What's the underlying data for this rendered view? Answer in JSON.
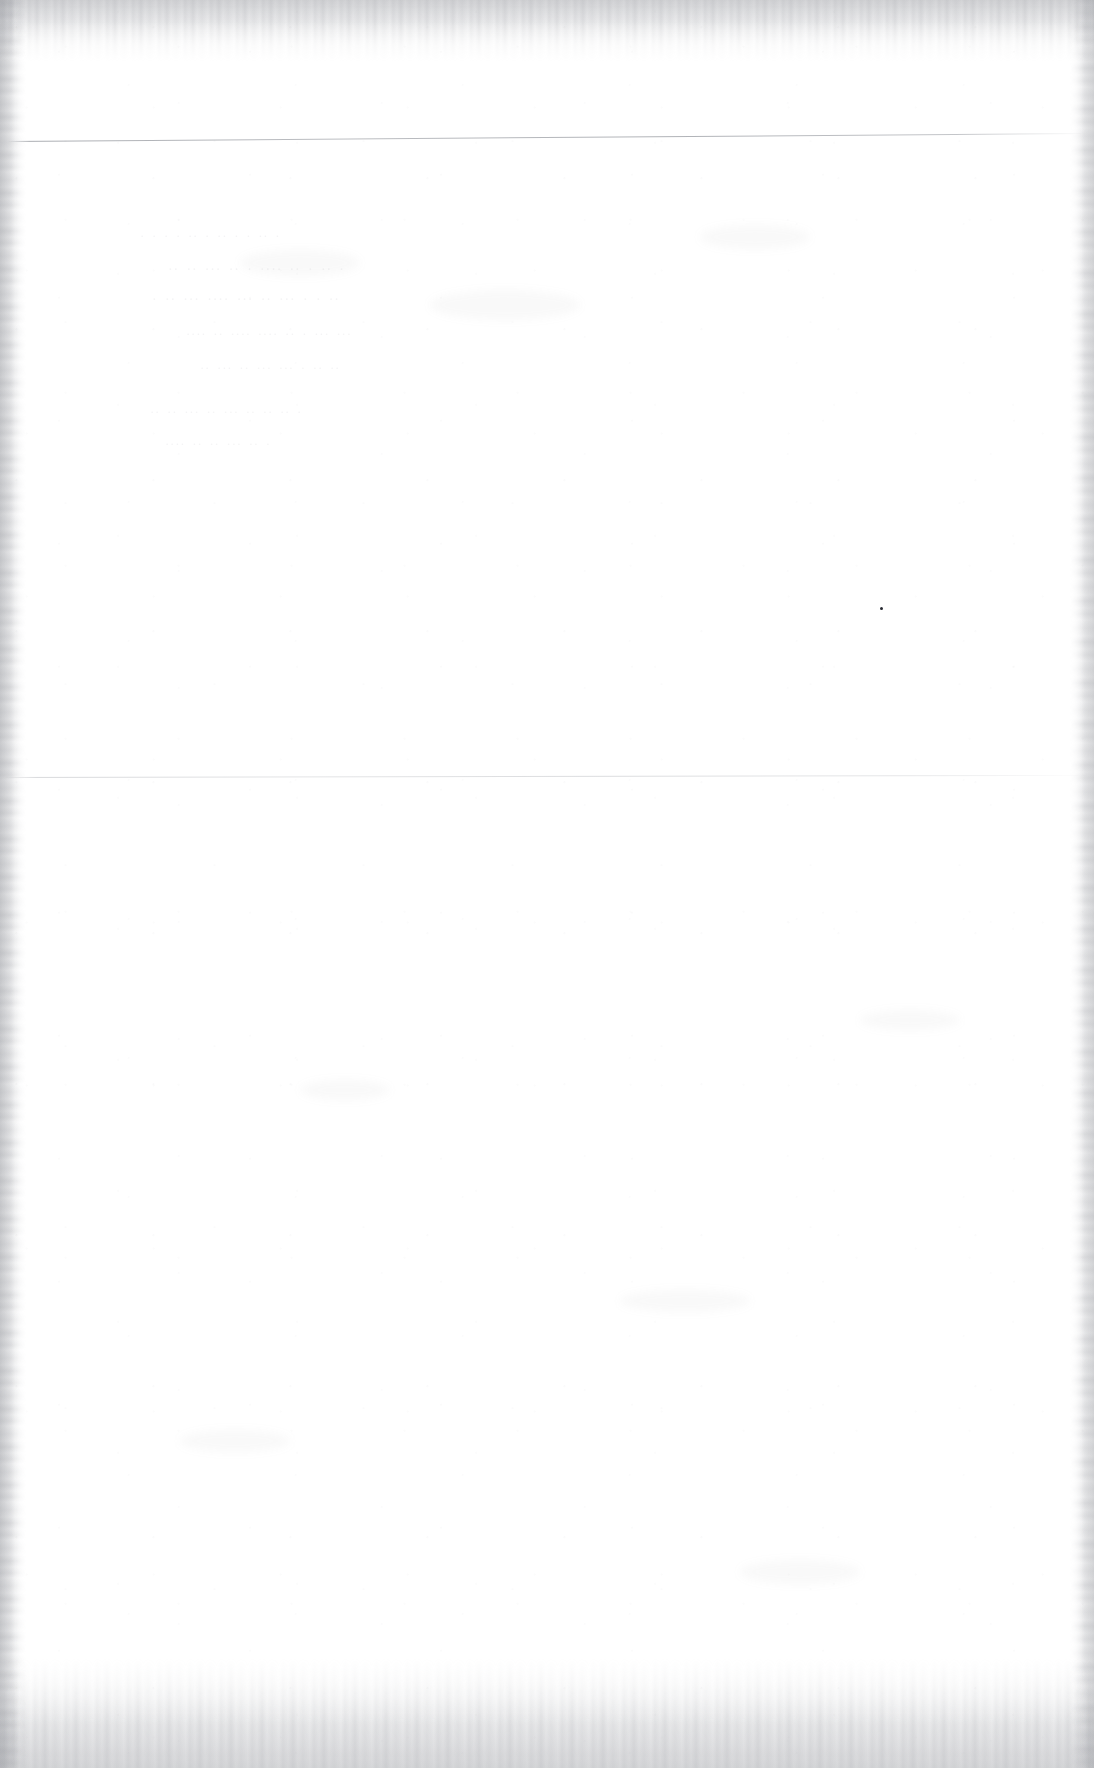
{
  "page": {
    "kind": "scanned-document-page",
    "state": "blank",
    "width": 1094,
    "height": 1768,
    "background_color": "#ffffff",
    "paper_tone": "#fefefe",
    "edge_noise_color": "#94969c",
    "visible_text": ""
  },
  "rules": [
    {
      "name": "upper-rule",
      "y": 141,
      "left": 8,
      "width": 1078,
      "tilt_deg": -0.42,
      "color": "#787c84",
      "opacity": "0.6"
    },
    {
      "name": "lower-rule",
      "y": 777,
      "left": 4,
      "width": 1086,
      "tilt_deg": -0.11,
      "color": "#80848c",
      "opacity": "0.28"
    }
  ],
  "edges": [
    {
      "name": "top-edge-noise",
      "thickness": 62
    },
    {
      "name": "bottom-edge-noise",
      "thickness": 110
    },
    {
      "name": "left-edge-noise",
      "thickness": 26
    },
    {
      "name": "right-edge-noise",
      "thickness": 24
    }
  ],
  "marks": [
    {
      "name": "ink-speck",
      "x": 880,
      "y": 607,
      "size": 3,
      "color": "#282a32"
    }
  ],
  "ghost_traces": {
    "note": "bleed-through from reverse side; barely visible, no legible characters",
    "region": {
      "x": 100,
      "y": 200,
      "width": 720,
      "height": 260
    },
    "lines": [
      {
        "x": 140,
        "y": 228,
        "size": 13,
        "text": "· · ·   · ·· ·   ·· ·  ·   ·· ·"
      },
      {
        "x": 168,
        "y": 262,
        "size": 14,
        "text": "·· ··   ··· ·· ·   ···· ·· ·  ·· ·"
      },
      {
        "x": 152,
        "y": 292,
        "size": 14,
        "text": "· ·· ···  ···· ··· ·· ··· · ·  ··"
      },
      {
        "x": 186,
        "y": 326,
        "size": 13,
        "text": "···· ·· ···· ···· ·· · ··· ···"
      },
      {
        "x": 200,
        "y": 360,
        "size": 13,
        "text": "·· ··· ·· ··· ··· · ·· ··"
      },
      {
        "x": 150,
        "y": 404,
        "size": 13,
        "text": "·· ·· ···  ·· ··· ·· ··  ·· ·"
      },
      {
        "x": 165,
        "y": 436,
        "size": 13,
        "text": "···· ··  ·· ··· ·· ·"
      }
    ]
  },
  "smudges": [
    {
      "x": 240,
      "y": 250,
      "w": 120,
      "h": 26
    },
    {
      "x": 430,
      "y": 290,
      "w": 150,
      "h": 30
    },
    {
      "x": 700,
      "y": 225,
      "w": 110,
      "h": 24
    },
    {
      "x": 300,
      "y": 1080,
      "w": 90,
      "h": 20
    },
    {
      "x": 620,
      "y": 1290,
      "w": 130,
      "h": 22
    },
    {
      "x": 860,
      "y": 1010,
      "w": 100,
      "h": 20
    },
    {
      "x": 180,
      "y": 1430,
      "w": 110,
      "h": 22
    },
    {
      "x": 740,
      "y": 1560,
      "w": 120,
      "h": 24
    }
  ]
}
